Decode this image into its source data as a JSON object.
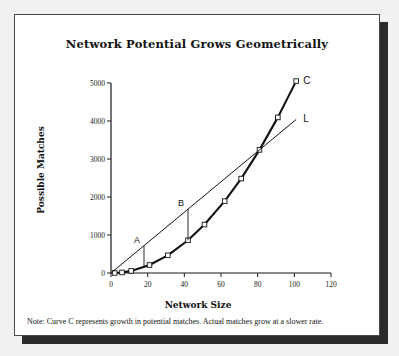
{
  "chart_data": {
    "type": "line",
    "title": "Network Potential Grows Geometrically",
    "xlabel": "Network Size",
    "ylabel": "Possible Matches",
    "xlim": [
      0,
      120
    ],
    "ylim": [
      0,
      5000
    ],
    "xticks": [
      0,
      20,
      40,
      60,
      80,
      100,
      120
    ],
    "yticks": [
      0,
      1000,
      2000,
      3000,
      4000,
      5000
    ],
    "grid": false,
    "legend_position": "inline-end-labels",
    "series": [
      {
        "name": "C",
        "label": "C",
        "description": "Curve C represents growth in potential matches (geometric / quadratic growth)",
        "marker": "open-square",
        "x": [
          2,
          6,
          11,
          21,
          31,
          42,
          51,
          62,
          71,
          81,
          91,
          101
        ],
        "y": [
          1,
          15,
          55,
          210,
          465,
          861,
          1275,
          1891,
          2485,
          3240,
          4095,
          5050
        ]
      },
      {
        "name": "L",
        "label": "L",
        "description": "Reference straight line showing linear growth",
        "marker": "none",
        "x": [
          0,
          101
        ],
        "y": [
          0,
          4040
        ]
      }
    ],
    "annotations": [
      {
        "label": "A",
        "x": 18,
        "y_top": 720,
        "y_bottom": 160,
        "description": "Vertical gap between line L and curve C at small network size"
      },
      {
        "label": "B",
        "x": 42,
        "y_top": 1680,
        "y_bottom": 861,
        "description": "Vertical gap between line L and curve C at mid network size"
      }
    ],
    "note": "Note:  Curve C represents growth in potential matches. Actual matches grow at a slower rate."
  },
  "colors": {
    "page_background": "#f2f1ef",
    "card_background": "#ffffff",
    "border": "#4a4a4a",
    "shadow": "#2b2b2b",
    "ink": "#111111"
  }
}
